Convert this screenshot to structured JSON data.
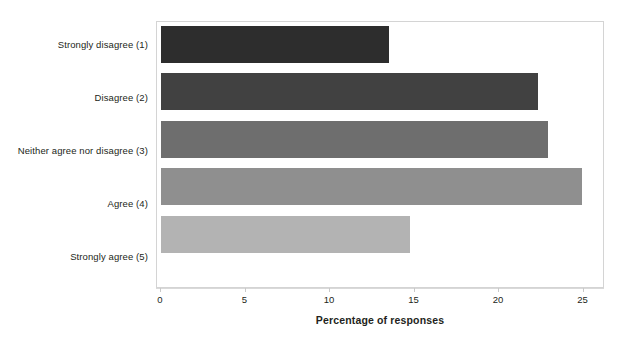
{
  "chart_data": {
    "type": "bar",
    "orientation": "horizontal",
    "title": "",
    "subtitle": "",
    "xlabel": "Percentage of responses",
    "ylabel": "",
    "categories": [
      "Strongly disagree (1)",
      "Disagree (2)",
      "Neither agree nor disagree (3)",
      "Agree (4)",
      "Strongly agree (5)"
    ],
    "values": [
      13.5,
      22.3,
      22.9,
      24.9,
      14.7
    ],
    "series": [
      {
        "name": "Percentage of responses",
        "values": [
          13.5,
          22.3,
          22.9,
          24.9,
          14.7
        ]
      }
    ],
    "bar_colors": [
      "#2d2d2d",
      "#414141",
      "#6e6e6e",
      "#8f8f8f",
      "#b3b3b3"
    ],
    "xlim": [
      0,
      26.5
    ],
    "xticks": [
      0,
      5,
      10,
      15,
      20,
      25
    ],
    "xtick_labels": [
      "0",
      "5",
      "10",
      "15",
      "20",
      "25"
    ],
    "grid": false,
    "legend": "none",
    "plot_border_color": "#d4d4d4",
    "axis_line_color": "#d9d9d9",
    "background_color": "#ffffff",
    "text_color": "#231f20"
  }
}
